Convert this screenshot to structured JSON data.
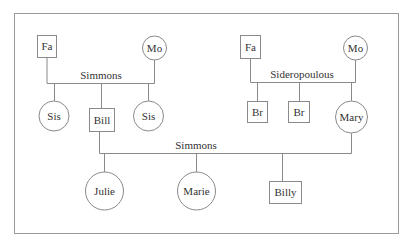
{
  "diagram": {
    "type": "genogram",
    "families": [
      {
        "surname": "Simmons",
        "label_pos": [
          101,
          79
        ],
        "parents": [
          {
            "id": "fa1",
            "label": "Fa",
            "shape": "square"
          },
          {
            "id": "mo1",
            "label": "Mo",
            "shape": "circle"
          }
        ],
        "children": [
          {
            "id": "sis1",
            "label": "Sis",
            "shape": "circle"
          },
          {
            "id": "bill",
            "label": "Bill",
            "shape": "square"
          },
          {
            "id": "sis2",
            "label": "Sis",
            "shape": "circle"
          }
        ]
      },
      {
        "surname": "Sideropoulous",
        "label_pos": [
          302,
          78
        ],
        "parents": [
          {
            "id": "fa2",
            "label": "Fa",
            "shape": "square"
          },
          {
            "id": "mo2",
            "label": "Mo",
            "shape": "circle"
          }
        ],
        "children": [
          {
            "id": "br1",
            "label": "Br",
            "shape": "square"
          },
          {
            "id": "br2",
            "label": "Br",
            "shape": "square"
          },
          {
            "id": "mary",
            "label": "Mary",
            "shape": "circle"
          }
        ]
      },
      {
        "surname": "Simmons",
        "label_pos": [
          196,
          149
        ],
        "parents": [
          {
            "id": "bill",
            "label": "Bill",
            "shape": "square"
          },
          {
            "id": "mary",
            "label": "Mary",
            "shape": "circle"
          }
        ],
        "children": [
          {
            "id": "julie",
            "label": "Julie",
            "shape": "circle"
          },
          {
            "id": "marie",
            "label": "Marie",
            "shape": "circle"
          },
          {
            "id": "billy",
            "label": "Billy",
            "shape": "square"
          }
        ]
      }
    ],
    "nodes": {
      "fa1": {
        "label": "Fa"
      },
      "mo1": {
        "label": "Mo"
      },
      "sis1": {
        "label": "Sis"
      },
      "bill": {
        "label": "Bill"
      },
      "sis2": {
        "label": "Sis"
      },
      "fa2": {
        "label": "Fa"
      },
      "mo2": {
        "label": "Mo"
      },
      "br1": {
        "label": "Br"
      },
      "br2": {
        "label": "Br"
      },
      "mary": {
        "label": "Mary"
      },
      "julie": {
        "label": "Julie"
      },
      "marie": {
        "label": "Marie"
      },
      "billy": {
        "label": "Billy"
      }
    },
    "labels": {
      "simmons_parents": "Simmons",
      "sideropoulous_parents": "Sideropoulous",
      "simmons_children": "Simmons"
    },
    "colors": {
      "line": "#8a8a8a",
      "text": "#333333",
      "background": "#ffffff"
    }
  }
}
